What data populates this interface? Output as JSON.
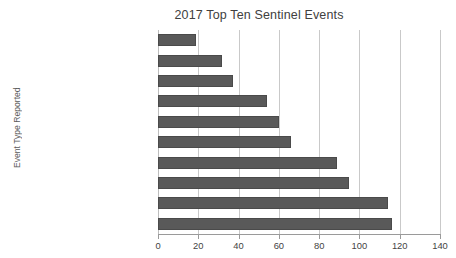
{
  "chart_data": {
    "type": "bar",
    "orientation": "horizontal",
    "title": "2017 Top Ten Sentinel Events",
    "xlabel": "",
    "ylabel": "Event Type Reported",
    "xlim": [
      0,
      140
    ],
    "ylim": null,
    "grid": "vertical",
    "legend": "none",
    "bar_color": "#595959",
    "bar_edge_color": "#4a4a4a",
    "gridline_color": "#c9c9c9",
    "axis_color": "#9a9a9a",
    "xticks": [
      0,
      20,
      40,
      60,
      80,
      100,
      120,
      140
    ],
    "xtick_labels": [
      "0",
      "20",
      "40",
      "60",
      "80",
      "100",
      "120",
      "140"
    ],
    "categories": [
      "Post-op complication",
      "Medication error",
      "Criminal event",
      "Unassigned",
      "Other unanticipated event",
      "Delay in treatment",
      "Suicide",
      "Wrong surgery",
      "Falls",
      "Retained foreign body"
    ],
    "values": [
      19,
      32,
      37,
      54,
      60,
      66,
      89,
      95,
      114,
      116
    ]
  }
}
